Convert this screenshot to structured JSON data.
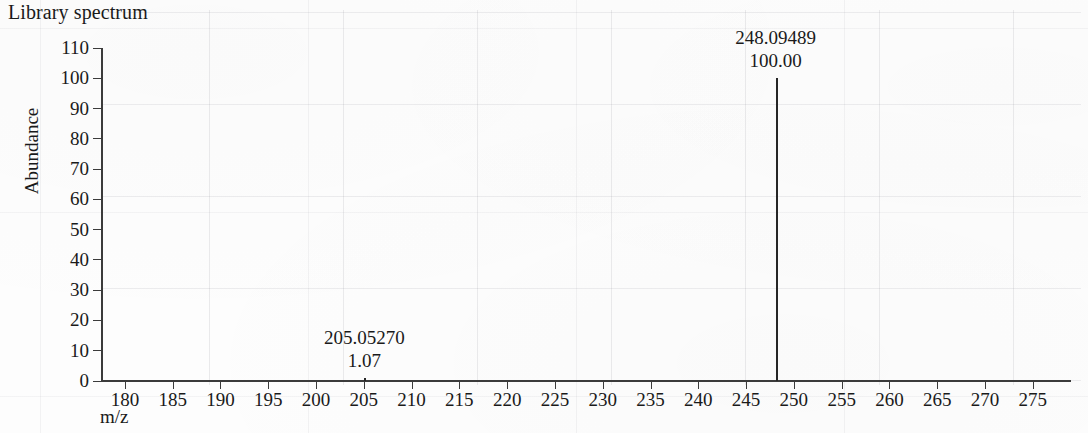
{
  "chart_data": {
    "type": "bar",
    "title": "Library spectrum",
    "xlabel": "m/z",
    "ylabel": "Abundance",
    "xlim": [
      177.5,
      279.0
    ],
    "ylim": [
      0,
      110
    ],
    "grid": "faint-paper-grid",
    "legend": "none",
    "x_ticks": [
      180,
      185,
      190,
      195,
      200,
      205,
      210,
      215,
      220,
      225,
      230,
      235,
      240,
      245,
      250,
      255,
      260,
      265,
      270,
      275
    ],
    "y_ticks": [
      0,
      10,
      20,
      30,
      40,
      50,
      60,
      70,
      80,
      90,
      100,
      110
    ],
    "x": [
      205.0527,
      248.09489
    ],
    "values": [
      1.07,
      100.0
    ],
    "peaks": [
      {
        "mz": 205.0527,
        "mz_label": "205.05270",
        "abundance": 1.07,
        "abundance_label": "1.07",
        "annotation_anchor_mz": 205.0527
      },
      {
        "mz": 248.09489,
        "mz_label": "248.09489",
        "abundance": 100.0,
        "abundance_label": "100.00",
        "annotation_anchor_mz": 248.09489
      }
    ],
    "colors": {
      "peak": "#262626",
      "axis": "#3b3b3b",
      "text": "#1a1a1a",
      "background": "#fdfdfd",
      "grid": "#8c8c96"
    }
  }
}
